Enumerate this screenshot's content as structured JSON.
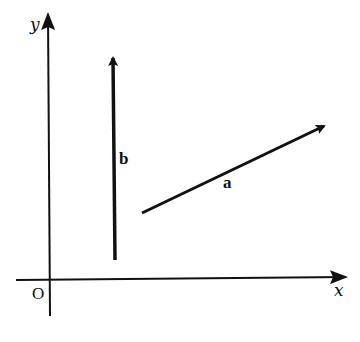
{
  "diagram": {
    "type": "vector-diagram",
    "axes": {
      "x_label": "x",
      "y_label": "y",
      "origin_label": "O"
    },
    "vectors": [
      {
        "name": "a",
        "label": "a",
        "direction": "up-right",
        "from": [
          142,
          212
        ],
        "to": [
          324,
          126
        ]
      },
      {
        "name": "b",
        "label": "b",
        "direction": "up",
        "from": [
          115,
          260
        ],
        "to": [
          115,
          58
        ]
      }
    ],
    "colors": {
      "stroke": "#111111",
      "background": "#ffffff"
    }
  }
}
